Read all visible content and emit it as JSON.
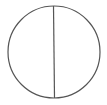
{
  "diagram": {
    "shape": "circle-divided-vertically",
    "circle": {
      "cx": 54,
      "cy": 52,
      "r": 46,
      "stroke": "#555555",
      "stroke_width": 1.2,
      "fill": "#ffffff"
    },
    "divider": {
      "x1": 53.5,
      "y1": 6,
      "x2": 54.5,
      "y2": 98,
      "stroke": "#555555",
      "stroke_width": 1.2
    }
  }
}
